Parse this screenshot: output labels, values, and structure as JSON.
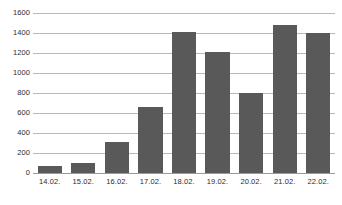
{
  "chart_data": {
    "type": "bar",
    "title": "",
    "subtitle": "",
    "xlabel": "",
    "ylabel": "",
    "categories": [
      "14.02.",
      "15.02.",
      "16.02.",
      "17.02.",
      "18.02.",
      "19.02.",
      "20.02.",
      "21.02.",
      "22.02."
    ],
    "values": [
      70,
      100,
      310,
      665,
      1410,
      1215,
      800,
      1480,
      1405
    ],
    "series": [
      {
        "name": "",
        "values": [
          70,
          100,
          310,
          665,
          1410,
          1215,
          800,
          1480,
          1405
        ]
      }
    ],
    "ylim": [
      0,
      1600
    ],
    "ytick_labels": [
      "0",
      "200",
      "400",
      "600",
      "800",
      "1000",
      "1200",
      "1400",
      "1600"
    ],
    "ytick_values": [
      0,
      200,
      400,
      600,
      800,
      1000,
      1200,
      1400,
      1600
    ],
    "grid": "horizontal",
    "legend": "none",
    "bar_color": "#595959",
    "grid_color": "#b8b8b8",
    "axis_color": "#9a9a9a",
    "background_color": "#ffffff"
  }
}
